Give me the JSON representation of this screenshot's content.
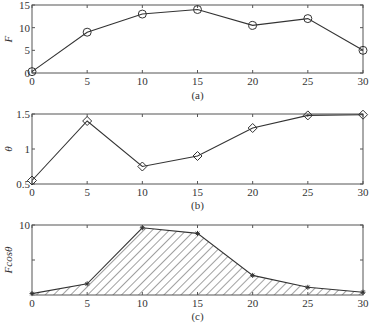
{
  "chart_data": [
    {
      "id": "a",
      "type": "line",
      "caption": "(a)",
      "ylabel": "F",
      "xlabel": "",
      "x": [
        0,
        5,
        10,
        15,
        20,
        25,
        30
      ],
      "series": [
        {
          "name": "F",
          "marker": "circle",
          "values": [
            0.3,
            9,
            13,
            14,
            10.5,
            12,
            5
          ]
        }
      ],
      "xlim": [
        0,
        30
      ],
      "ylim": [
        0,
        15
      ],
      "xticks": [
        0,
        5,
        10,
        15,
        20,
        25,
        30
      ],
      "yticks": [
        0,
        5,
        10,
        15
      ],
      "yticklabels": [
        "0",
        "5",
        "10",
        "15"
      ],
      "grid": false,
      "box": {
        "left": 32,
        "top": 5,
        "right": 363,
        "bottom": 73
      },
      "caption_y": 99
    },
    {
      "id": "b",
      "type": "line",
      "caption": "(b)",
      "ylabel": "θ",
      "xlabel": "",
      "x": [
        0,
        5,
        10,
        15,
        20,
        25,
        30
      ],
      "series": [
        {
          "name": "θ",
          "marker": "diamond",
          "values": [
            0.55,
            1.4,
            0.75,
            0.9,
            1.3,
            1.48,
            1.49
          ]
        }
      ],
      "xlim": [
        0,
        30
      ],
      "ylim": [
        0.5,
        1.5
      ],
      "xticks": [
        0,
        5,
        10,
        15,
        20,
        25,
        30
      ],
      "yticks": [
        0.5,
        1,
        1.5
      ],
      "yticklabels": [
        "0.5",
        "1",
        "1.5"
      ],
      "grid": false,
      "box": {
        "left": 32,
        "top": 114,
        "right": 363,
        "bottom": 184
      },
      "caption_y": 209
    },
    {
      "id": "c",
      "type": "area",
      "caption": "(c)",
      "ylabel": "Fcosθ",
      "xlabel": "",
      "x": [
        0,
        5,
        10,
        15,
        20,
        25,
        30
      ],
      "series": [
        {
          "name": "Fcosθ",
          "marker": "star",
          "fill": "hatched",
          "values": [
            0.2,
            1.6,
            9.6,
            8.8,
            2.8,
            1.1,
            0.4
          ]
        }
      ],
      "xlim": [
        0,
        30
      ],
      "ylim": [
        0,
        10
      ],
      "xticks": [
        0,
        5,
        10,
        15,
        20,
        25,
        30
      ],
      "yticks": [
        5,
        10
      ],
      "yticklabels": [
        "",
        "10"
      ],
      "grid": false,
      "box": {
        "left": 32,
        "top": 225,
        "right": 363,
        "bottom": 295
      },
      "caption_y": 320
    }
  ],
  "xticklabels": [
    "0",
    "5",
    "10",
    "15",
    "20",
    "25",
    "30"
  ]
}
